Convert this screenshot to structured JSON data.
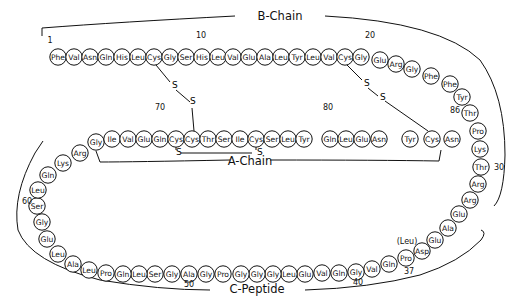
{
  "labels": {
    "b_chain": "B-Chain",
    "a_chain": "A-Chain",
    "c_peptide": "C-Peptide"
  },
  "position_numbers": [
    {
      "text": "1",
      "x": 50,
      "y": 43
    },
    {
      "text": "10",
      "x": 201,
      "y": 38
    },
    {
      "text": "20",
      "x": 370,
      "y": 38
    },
    {
      "text": "30",
      "x": 499,
      "y": 170
    },
    {
      "text": "37",
      "x": 409,
      "y": 274
    },
    {
      "text": "40",
      "x": 358,
      "y": 285
    },
    {
      "text": "50",
      "x": 189,
      "y": 287
    },
    {
      "text": "60",
      "x": 27,
      "y": 204
    },
    {
      "text": "70",
      "x": 160,
      "y": 110
    },
    {
      "text": "80",
      "x": 328,
      "y": 110
    },
    {
      "text": "86",
      "x": 455,
      "y": 113
    }
  ],
  "variant_label": {
    "text": "(Leu)",
    "x": 407,
    "y": 244
  },
  "disulfide_labels": {
    "s": "S"
  },
  "residues": [
    {
      "n": 1,
      "aa": "Phe",
      "x": 58,
      "y": 57
    },
    {
      "n": 2,
      "aa": "Val",
      "x": 74,
      "y": 57
    },
    {
      "n": 3,
      "aa": "Asn",
      "x": 90,
      "y": 57
    },
    {
      "n": 4,
      "aa": "Gln",
      "x": 106,
      "y": 57
    },
    {
      "n": 5,
      "aa": "His",
      "x": 122,
      "y": 57
    },
    {
      "n": 6,
      "aa": "Leu",
      "x": 138,
      "y": 57
    },
    {
      "n": 7,
      "aa": "Cys",
      "x": 154,
      "y": 57
    },
    {
      "n": 8,
      "aa": "Gly",
      "x": 170,
      "y": 57
    },
    {
      "n": 9,
      "aa": "Ser",
      "x": 186,
      "y": 57
    },
    {
      "n": 10,
      "aa": "His",
      "x": 202,
      "y": 57
    },
    {
      "n": 11,
      "aa": "Leu",
      "x": 218,
      "y": 57
    },
    {
      "n": 12,
      "aa": "Val",
      "x": 233,
      "y": 57
    },
    {
      "n": 13,
      "aa": "Glu",
      "x": 249,
      "y": 57
    },
    {
      "n": 14,
      "aa": "Ala",
      "x": 265,
      "y": 57
    },
    {
      "n": 15,
      "aa": "Leu",
      "x": 281,
      "y": 57
    },
    {
      "n": 16,
      "aa": "Tyr",
      "x": 297,
      "y": 57
    },
    {
      "n": 17,
      "aa": "Leu",
      "x": 313,
      "y": 57
    },
    {
      "n": 18,
      "aa": "Val",
      "x": 329,
      "y": 57
    },
    {
      "n": 19,
      "aa": "Cys",
      "x": 345,
      "y": 57
    },
    {
      "n": 20,
      "aa": "Gly",
      "x": 361,
      "y": 57
    },
    {
      "n": 21,
      "aa": "Glu",
      "x": 380,
      "y": 60
    },
    {
      "n": 22,
      "aa": "Arg",
      "x": 396,
      "y": 64
    },
    {
      "n": 23,
      "aa": "Gly",
      "x": 412,
      "y": 69
    },
    {
      "n": 24,
      "aa": "Phe",
      "x": 431,
      "y": 76
    },
    {
      "n": 25,
      "aa": "Phe",
      "x": 450,
      "y": 84
    },
    {
      "n": 26,
      "aa": "Tyr",
      "x": 462,
      "y": 97
    },
    {
      "n": 27,
      "aa": "Thr",
      "x": 470,
      "y": 113
    },
    {
      "n": 28,
      "aa": "Pro",
      "x": 478,
      "y": 131
    },
    {
      "n": 29,
      "aa": "Lys",
      "x": 480,
      "y": 149
    },
    {
      "n": 30,
      "aa": "Thr",
      "x": 481,
      "y": 167
    },
    {
      "n": 31,
      "aa": "Arg",
      "x": 478,
      "y": 184
    },
    {
      "n": 32,
      "aa": "Arg",
      "x": 470,
      "y": 200
    },
    {
      "n": 33,
      "aa": "Glu",
      "x": 459,
      "y": 214
    },
    {
      "n": 34,
      "aa": "Ala",
      "x": 448,
      "y": 228
    },
    {
      "n": 35,
      "aa": "Glu",
      "x": 435,
      "y": 240
    },
    {
      "n": 36,
      "aa": "Asp",
      "x": 422,
      "y": 251
    },
    {
      "n": 37,
      "aa": "Pro",
      "x": 406,
      "y": 258
    },
    {
      "n": 38,
      "aa": "Gln",
      "x": 389,
      "y": 264
    },
    {
      "n": 39,
      "aa": "Val",
      "x": 372,
      "y": 269
    },
    {
      "n": 40,
      "aa": "Gly",
      "x": 356,
      "y": 272
    },
    {
      "n": 41,
      "aa": "Gln",
      "x": 339,
      "y": 273
    },
    {
      "n": 42,
      "aa": "Val",
      "x": 322,
      "y": 273
    },
    {
      "n": 43,
      "aa": "Glu",
      "x": 305,
      "y": 274
    },
    {
      "n": 44,
      "aa": "Leu",
      "x": 289,
      "y": 274
    },
    {
      "n": 45,
      "aa": "Gly",
      "x": 273,
      "y": 274
    },
    {
      "n": 46,
      "aa": "Gly",
      "x": 257,
      "y": 274
    },
    {
      "n": 47,
      "aa": "Gly",
      "x": 241,
      "y": 274
    },
    {
      "n": 48,
      "aa": "Pro",
      "x": 223,
      "y": 274
    },
    {
      "n": 49,
      "aa": "Gly",
      "x": 206,
      "y": 274
    },
    {
      "n": 50,
      "aa": "Ala",
      "x": 189,
      "y": 274
    },
    {
      "n": 51,
      "aa": "Gly",
      "x": 172,
      "y": 274
    },
    {
      "n": 52,
      "aa": "Ser",
      "x": 155,
      "y": 274
    },
    {
      "n": 53,
      "aa": "Leu",
      "x": 139,
      "y": 274
    },
    {
      "n": 54,
      "aa": "Gln",
      "x": 123,
      "y": 274
    },
    {
      "n": 55,
      "aa": "Pro",
      "x": 106,
      "y": 273
    },
    {
      "n": 56,
      "aa": "Leu",
      "x": 89,
      "y": 270
    },
    {
      "n": 57,
      "aa": "Ala",
      "x": 73,
      "y": 264
    },
    {
      "n": 58,
      "aa": "Leu",
      "x": 58,
      "y": 254
    },
    {
      "n": 59,
      "aa": "Glu",
      "x": 47,
      "y": 239
    },
    {
      "n": 60,
      "aa": "Gly",
      "x": 42,
      "y": 222
    },
    {
      "n": 61,
      "aa": "Ser",
      "x": 37,
      "y": 206
    },
    {
      "n": 62,
      "aa": "Leu",
      "x": 38,
      "y": 190
    },
    {
      "n": 63,
      "aa": "Gln",
      "x": 48,
      "y": 175
    },
    {
      "n": 64,
      "aa": "Lys",
      "x": 63,
      "y": 163
    },
    {
      "n": 65,
      "aa": "Arg",
      "x": 80,
      "y": 153
    },
    {
      "n": 66,
      "aa": "Gly",
      "x": 96,
      "y": 142
    },
    {
      "n": 67,
      "aa": "Ile",
      "x": 112,
      "y": 139
    },
    {
      "n": 68,
      "aa": "Val",
      "x": 128,
      "y": 139
    },
    {
      "n": 69,
      "aa": "Glu",
      "x": 144,
      "y": 139
    },
    {
      "n": 70,
      "aa": "Gln",
      "x": 160,
      "y": 139
    },
    {
      "n": 71,
      "aa": "Cys",
      "x": 176,
      "y": 139
    },
    {
      "n": 72,
      "aa": "Cys",
      "x": 192,
      "y": 139
    },
    {
      "n": 73,
      "aa": "Thr",
      "x": 208,
      "y": 139
    },
    {
      "n": 74,
      "aa": "Ser",
      "x": 224,
      "y": 139
    },
    {
      "n": 75,
      "aa": "Ile",
      "x": 240,
      "y": 139
    },
    {
      "n": 76,
      "aa": "Cys",
      "x": 256,
      "y": 139
    },
    {
      "n": 77,
      "aa": "Ser",
      "x": 272,
      "y": 139
    },
    {
      "n": 78,
      "aa": "Leu",
      "x": 288,
      "y": 139
    },
    {
      "n": 79,
      "aa": "Tyr",
      "x": 304,
      "y": 139
    },
    {
      "n": 80,
      "aa": "Gln",
      "x": 330,
      "y": 139
    },
    {
      "n": 81,
      "aa": "Leu",
      "x": 346,
      "y": 139
    },
    {
      "n": 82,
      "aa": "Glu",
      "x": 362,
      "y": 139
    },
    {
      "n": 83,
      "aa": "Asn",
      "x": 379,
      "y": 139
    },
    {
      "n": 84,
      "aa": "Tyr",
      "x": 410,
      "y": 139
    },
    {
      "n": 85,
      "aa": "Cys",
      "x": 432,
      "y": 139
    },
    {
      "n": 86,
      "aa": "Asn",
      "x": 452,
      "y": 139
    }
  ]
}
